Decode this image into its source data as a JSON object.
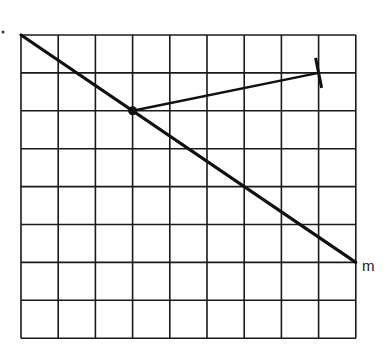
{
  "diagram": {
    "grid": {
      "columns": 9,
      "rows": 8,
      "origin_px": [
        21,
        35
      ],
      "cell_w": 37.2,
      "cell_h": 37.9,
      "line_color": "#1a1a1a"
    },
    "line_m": {
      "label": "m",
      "from_grid": [
        0,
        0
      ],
      "to_grid": [
        9,
        6
      ],
      "color": "#111111"
    },
    "point": {
      "grid": [
        3,
        2
      ]
    },
    "segment": {
      "from_grid": [
        3,
        2
      ],
      "to_grid": [
        8,
        1
      ],
      "end_tick": true
    }
  }
}
